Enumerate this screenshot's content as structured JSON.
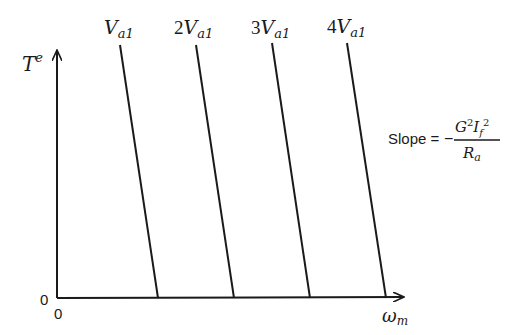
{
  "diagram": {
    "type": "torque-speed characteristics",
    "y_axis": {
      "label": "T",
      "label_sup": "e"
    },
    "x_axis": {
      "label": "ω",
      "label_sub": "m"
    },
    "origin": {
      "y_label": "0",
      "x_label": "0"
    },
    "lines": [
      {
        "coef": "",
        "label_main": "V",
        "label_sub": "a1",
        "x_top": 120,
        "y_top": 45,
        "x_bottom": 158,
        "y_bottom": 298
      },
      {
        "coef": "2",
        "label_main": "V",
        "label_sub": "a1",
        "x_top": 196,
        "y_top": 45,
        "x_bottom": 234,
        "y_bottom": 298
      },
      {
        "coef": "3",
        "label_main": "V",
        "label_sub": "a1",
        "x_top": 272,
        "y_top": 43,
        "x_bottom": 310,
        "y_bottom": 298
      },
      {
        "coef": "4",
        "label_main": "V",
        "label_sub": "a1",
        "x_top": 347,
        "y_top": 43,
        "x_bottom": 386,
        "y_bottom": 298
      }
    ],
    "slope_annotation": {
      "prefix": "Slope =",
      "sign": "−",
      "numerator": {
        "G": "G",
        "G_sup": "2",
        "I": "I",
        "I_sub": "f",
        "I_sup": "2"
      },
      "denominator": {
        "R": "R",
        "R_sub": "a"
      }
    },
    "colors": {
      "ink": "#1a1a1a",
      "background": "#ffffff"
    }
  }
}
